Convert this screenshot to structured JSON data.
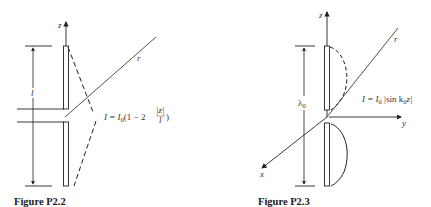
{
  "figures": [
    {
      "id": "P2.2",
      "caption": "Figure P2.2",
      "axis_label_z": "z",
      "ray_label": "r",
      "length_label": "l",
      "current_formula": {
        "lhs": "I = I",
        "sub0": "0",
        "body": "(1 − 2 ",
        "frac_num": "|z|",
        "frac_den": "l",
        "close": ")"
      },
      "distribution": "triangular"
    },
    {
      "id": "P2.3",
      "caption": "Figure P2.3",
      "axis_label_z": "z",
      "axis_label_y": "y",
      "axis_label_x": "x",
      "ray_label": "r",
      "length_label": "λ",
      "length_sub": "0",
      "current_formula": {
        "lhs": "I = I",
        "sub0": "0",
        "body": " |sin k",
        "sub1": "0",
        "tail": "z|"
      },
      "distribution": "sinusoidal"
    }
  ]
}
